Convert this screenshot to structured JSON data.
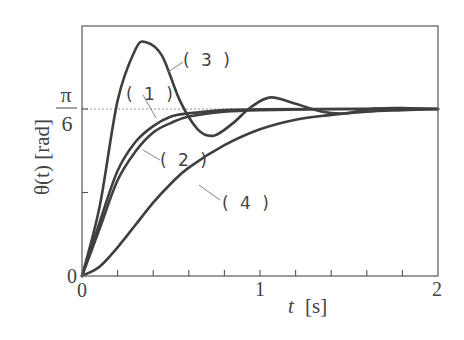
{
  "chart_data": {
    "type": "line",
    "title": "",
    "xlabel": "t [s]",
    "ylabel": "θ(t) [rad]",
    "xlim": [
      0,
      2
    ],
    "ylim": [
      0,
      0.733
    ],
    "x_ticks": [
      0,
      0.2,
      0.4,
      0.6,
      0.8,
      1.0,
      1.2,
      1.4,
      1.6,
      1.8,
      2.0
    ],
    "x_tick_labels": [
      {
        "value": 0,
        "label": "0"
      },
      {
        "value": 1,
        "label": "1"
      },
      {
        "value": 2,
        "label": "2"
      }
    ],
    "y_ticks": [
      0,
      0.2618,
      0.5236
    ],
    "y_tick_labels": [
      {
        "value": 0,
        "label": "0"
      },
      {
        "value": 0.5236,
        "label": "π/6",
        "numerator": "π",
        "denominator": "6"
      }
    ],
    "reference_line": {
      "y": 0.5236,
      "style": "dotted",
      "label": "π/6"
    },
    "grid": false,
    "legend": "inline labels",
    "series": [
      {
        "name": "(1)",
        "label": "( 1 )",
        "x": [
          0,
          0.1,
          0.2,
          0.3,
          0.4,
          0.5,
          0.6,
          0.8,
          1.0,
          1.5,
          2.0
        ],
        "values": [
          0,
          0.17,
          0.33,
          0.42,
          0.47,
          0.5,
          0.51,
          0.52,
          0.523,
          0.5236,
          0.5236
        ]
      },
      {
        "name": "(2)",
        "label": "( 2 )",
        "x": [
          0,
          0.1,
          0.2,
          0.3,
          0.4,
          0.5,
          0.6,
          0.8,
          1.0,
          1.5,
          2.0
        ],
        "values": [
          0,
          0.15,
          0.3,
          0.39,
          0.45,
          0.48,
          0.5,
          0.515,
          0.52,
          0.5236,
          0.5236
        ]
      },
      {
        "name": "(3)",
        "label": "( 3 )",
        "x": [
          0,
          0.1,
          0.2,
          0.3,
          0.36,
          0.45,
          0.55,
          0.65,
          0.74,
          0.85,
          0.95,
          1.06,
          1.2,
          1.35,
          1.48,
          1.65,
          1.85,
          2.0
        ],
        "values": [
          0,
          0.22,
          0.55,
          0.71,
          0.733,
          0.69,
          0.55,
          0.46,
          0.44,
          0.48,
          0.53,
          0.56,
          0.54,
          0.515,
          0.51,
          0.525,
          0.526,
          0.5236
        ]
      },
      {
        "name": "(4)",
        "label": "( 4 )",
        "x": [
          0,
          0.1,
          0.2,
          0.3,
          0.4,
          0.5,
          0.6,
          0.8,
          1.0,
          1.2,
          1.4,
          1.6,
          1.8,
          2.0
        ],
        "values": [
          0,
          0.03,
          0.09,
          0.16,
          0.23,
          0.29,
          0.34,
          0.41,
          0.46,
          0.49,
          0.505,
          0.515,
          0.52,
          0.5236
        ]
      }
    ]
  },
  "labels": {
    "y_axis": "θ(t) [rad]",
    "x_axis_var": "t",
    "x_axis_unit": "[s]",
    "origin_x": "0",
    "origin_y": "0",
    "x_one": "1",
    "x_two": "2",
    "pi": "π",
    "six": "6",
    "curve1": "( 1 )",
    "curve2": "( 2 )",
    "curve3": "( 3 )",
    "curve4": "( 4 )"
  }
}
